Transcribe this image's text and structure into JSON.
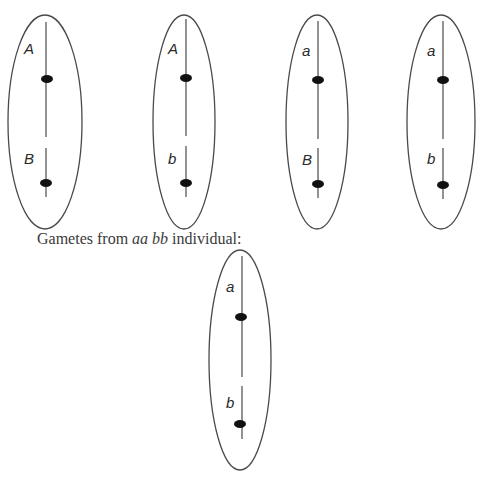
{
  "caption": {
    "prefix": "Gametes from ",
    "genotype": "aa bb",
    "suffix": " individual:"
  },
  "top_row_gametes": [
    {
      "id": "gamete-AB",
      "upper_allele": "A",
      "lower_allele": "B",
      "cx": 45,
      "rx": 37,
      "label_x": 24,
      "line_x": 46
    },
    {
      "id": "gamete-Ab",
      "upper_allele": "A",
      "lower_allele": "b",
      "cx": 184,
      "rx": 31,
      "label_x": 168,
      "line_x": 186
    },
    {
      "id": "gamete-aB",
      "upper_allele": "a",
      "lower_allele": "B",
      "cx": 317,
      "rx": 31,
      "label_x": 302,
      "line_x": 318
    },
    {
      "id": "gamete-ab",
      "upper_allele": "a",
      "lower_allele": "b",
      "cx": 441,
      "rx": 34,
      "label_x": 427,
      "line_x": 443
    }
  ],
  "bottom_gamete": {
    "id": "gamete-ab-tester",
    "upper_allele": "a",
    "lower_allele": "b",
    "cx": 240,
    "rx": 31,
    "label_x": 226,
    "line_x": 242
  },
  "colors": {
    "stroke": "#4a4a4a",
    "centromere": "#111111",
    "text": "#2a2a2a"
  }
}
